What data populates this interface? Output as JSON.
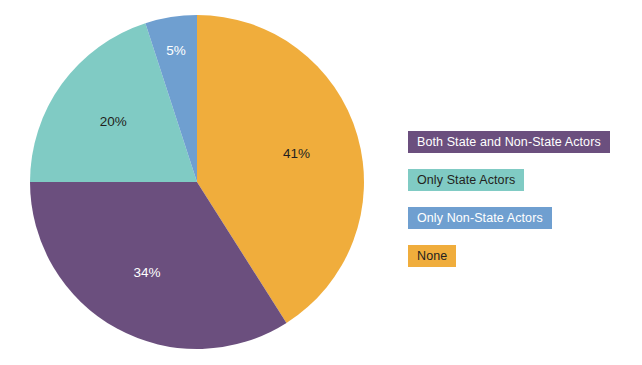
{
  "chart_data": {
    "type": "pie",
    "title": "",
    "subtitle": "",
    "xlabel": "",
    "ylabel": "",
    "grid": false,
    "legend_position": "right",
    "start_angle_deg": 0,
    "direction": "clockwise",
    "units": "percent",
    "total": 100,
    "categories": [
      "None",
      "Both State and Non-State Actors",
      "Only State Actors",
      "Only Non-State Actors"
    ],
    "values": [
      41,
      34,
      20,
      5
    ],
    "slices": [
      {
        "label": "None",
        "value": 41,
        "data_label": "41%",
        "color": "#F0AD3C",
        "label_text_color": "#231f20",
        "start_deg": 0,
        "end_deg": 147.6
      },
      {
        "label": "Both State and Non-State Actors",
        "value": 34,
        "data_label": "34%",
        "color": "#6B4F7E",
        "label_text_color": "#ffffff",
        "start_deg": 147.6,
        "end_deg": 270
      },
      {
        "label": "Only State Actors",
        "value": 20,
        "data_label": "20%",
        "color": "#80CBC4",
        "label_text_color": "#231f20",
        "start_deg": 270,
        "end_deg": 342
      },
      {
        "label": "Only Non-State Actors",
        "value": 5,
        "data_label": "5%",
        "color": "#6F9FD0",
        "label_text_color": "#ffffff",
        "start_deg": 342,
        "end_deg": 360
      }
    ]
  },
  "pie": {
    "labels": {
      "none": "41%",
      "both": "34%",
      "state": "20%",
      "nonstate": "5%"
    }
  },
  "legend": {
    "items": [
      {
        "label": "Both State and Non-State Actors",
        "color": "#6B4F7E",
        "text_color": "#ffffff"
      },
      {
        "label": "Only State Actors",
        "color": "#80CBC4",
        "text_color": "#231f20"
      },
      {
        "label": "Only Non-State Actors",
        "color": "#6F9FD0",
        "text_color": "#ffffff"
      },
      {
        "label": "None",
        "color": "#F0AD3C",
        "text_color": "#231f20"
      }
    ]
  },
  "colors": {
    "background": "#ffffff",
    "orange": "#F0AD3C",
    "purple": "#6B4F7E",
    "teal": "#80CBC4",
    "blue": "#6F9FD0",
    "text_dark": "#231f20",
    "text_light": "#ffffff"
  }
}
